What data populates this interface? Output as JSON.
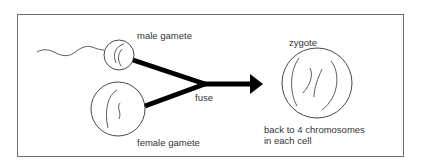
{
  "diagram": {
    "type": "fertilisation-process",
    "labels": {
      "male_gamete": "male gamete",
      "female_gamete": "female gamete",
      "fuse": "fuse",
      "zygote": "zygote",
      "zygote_note_line1": "back to 4 chromosomes",
      "zygote_note_line2": "in each cell"
    },
    "nodes": [
      {
        "id": "male-gamete",
        "label": "male gamete",
        "shape": "small circle with tail (sperm)"
      },
      {
        "id": "female-gamete",
        "label": "female gamete",
        "shape": "large circle (egg)"
      },
      {
        "id": "zygote",
        "label": "zygote",
        "shape": "large circle with chromosomes"
      }
    ],
    "edges": [
      {
        "from": "male-gamete",
        "to": "fuse-point"
      },
      {
        "from": "female-gamete",
        "to": "fuse-point"
      },
      {
        "from": "fuse-point",
        "to": "zygote",
        "label": "fuse",
        "arrow": true
      }
    ],
    "colors": {
      "ink": "#000000",
      "frame": "#6e6e6e",
      "background": "#ffffff"
    }
  }
}
